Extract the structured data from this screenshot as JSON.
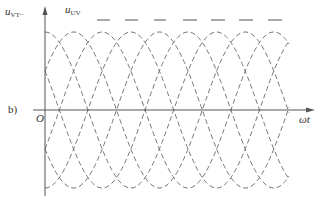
{
  "figure": {
    "panel_label": "b)",
    "origin_label": "O",
    "y_axis_label": {
      "base": "u",
      "sub": "VT−"
    },
    "series_label": {
      "base": "u",
      "sub": "UV"
    },
    "x_axis_label": "ωt"
  },
  "colors": {
    "axis": "#555555",
    "wave": "#777777",
    "envelope": "#555555",
    "text": "#333333"
  },
  "chart_data": {
    "type": "line",
    "title": "",
    "xlabel": "ωt",
    "ylabel": "u_VT−",
    "annotation": "u_UV",
    "panel": "b)",
    "grid": false,
    "series_count": 6,
    "phase_step_deg": 60,
    "amplitude_norm": 1.0,
    "envelope_level_norm": 1.15,
    "x_range_deg": [
      0,
      510
    ],
    "y_range_norm": [
      -1.0,
      1.0
    ],
    "peak_spacing_deg": 60,
    "zero_crossing_spacing_deg": 60,
    "layout": {
      "origin_px": [
        45,
        110
      ],
      "px_per_60deg": 28.6,
      "amplitude_px": 78,
      "wave_start_px": 45,
      "wave_end_px": 289,
      "x_axis_end_px": 315,
      "y_axis_top_px": 6,
      "y_axis_bottom_px": 196,
      "envelope_y_px": 20,
      "envelope_dashes_px": [
        [
          97,
          110
        ],
        [
          125,
          138
        ],
        [
          154,
          166
        ],
        [
          183,
          197
        ],
        [
          211,
          225
        ],
        [
          239,
          253
        ],
        [
          268,
          282
        ]
      ]
    }
  }
}
